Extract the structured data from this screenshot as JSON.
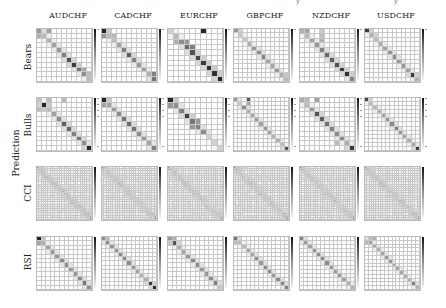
{
  "figure": {
    "top_fragments": [
      "y",
      "y"
    ],
    "group_label": "Prediction",
    "columns": [
      "AUDCHF",
      "CADCHF",
      "EURCHF",
      "GBPCHF",
      "NZDCHF",
      "USDCHF"
    ],
    "rows": [
      "Bears",
      "Bulls",
      "CCI",
      "RSI"
    ]
  },
  "chart_data": {
    "type": "heatmap",
    "title": "",
    "xlabel": "",
    "ylabel": "Prediction",
    "colormap": "greys",
    "colorbar": true,
    "grid": true,
    "layout": {
      "rows": 4,
      "cols": 6
    },
    "panels": [
      {
        "row": "Bears",
        "col": "AUDCHF",
        "size": 11,
        "diag": [
          0.45,
          0.3,
          0.35,
          0.4,
          0.45,
          0.55,
          0.75,
          0.85,
          0.6,
          0.5,
          0.3
        ],
        "extra": [
          [
            0,
            2,
            0.4
          ],
          [
            1,
            0,
            0.35
          ],
          [
            0,
            1,
            0.15
          ],
          [
            8,
            9,
            0.4
          ],
          [
            9,
            10,
            0.3
          ]
        ]
      },
      {
        "row": "Bears",
        "col": "CADCHF",
        "size": 11,
        "diag": [
          0.95,
          0.3,
          0.3,
          0.4,
          0.55,
          0.7,
          0.55,
          0.45,
          0.4,
          0.35,
          0.6
        ],
        "extra": [
          [
            1,
            0,
            0.45
          ],
          [
            1,
            2,
            0.3
          ],
          [
            9,
            10,
            0.55
          ]
        ]
      },
      {
        "row": "Bears",
        "col": "EURCHF",
        "size": 10,
        "diag": [
          0.2,
          0.3,
          0.5,
          0.65,
          0.75,
          0.8,
          0.85,
          0.9,
          0.9,
          0.95
        ],
        "extra": [
          [
            0,
            6,
            0.95
          ],
          [
            2,
            1,
            0.35
          ],
          [
            2,
            3,
            0.45
          ],
          [
            3,
            4,
            0.55
          ]
        ]
      },
      {
        "row": "Bears",
        "col": "GBPCHF",
        "size": 12,
        "diag": [
          0.45,
          0.25,
          0.25,
          0.35,
          0.45,
          0.5,
          0.55,
          0.4,
          0.4,
          0.45,
          0.35,
          0.3
        ],
        "extra": [
          [
            0,
            1,
            0.2
          ],
          [
            10,
            11,
            0.25
          ]
        ]
      },
      {
        "row": "Bears",
        "col": "NZDCHF",
        "size": 11,
        "diag": [
          0.35,
          0.3,
          0.4,
          0.45,
          0.55,
          0.65,
          0.7,
          0.75,
          0.85,
          0.9,
          0.55
        ],
        "extra": [
          [
            0,
            1,
            0.4
          ],
          [
            0,
            4,
            0.25
          ],
          [
            1,
            4,
            0.3
          ],
          [
            2,
            4,
            0.35
          ]
        ]
      },
      {
        "row": "Bears",
        "col": "USDCHF",
        "size": 12,
        "diag": [
          0.85,
          0.35,
          0.3,
          0.35,
          0.4,
          0.45,
          0.5,
          0.45,
          0.45,
          0.4,
          0.85,
          0.35
        ],
        "extra": [
          [
            0,
            1,
            0.2
          ],
          [
            1,
            2,
            0.2
          ]
        ]
      },
      {
        "row": "Bulls",
        "col": "AUDCHF",
        "size": 11,
        "diag": [
          0.25,
          0.95,
          0.3,
          0.4,
          0.5,
          0.7,
          0.65,
          0.55,
          0.6,
          0.5,
          0.95
        ],
        "extra": [
          [
            0,
            2,
            0.3
          ],
          [
            0,
            5,
            0.3
          ],
          [
            2,
            0,
            0.3
          ],
          [
            2,
            1,
            0.25
          ]
        ]
      },
      {
        "row": "Bulls",
        "col": "CADCHF",
        "size": 11,
        "diag": [
          0.95,
          0.4,
          0.45,
          0.5,
          0.6,
          0.65,
          0.6,
          0.5,
          0.45,
          0.4,
          0.55
        ],
        "extra": [
          [
            1,
            0,
            0.4
          ]
        ]
      },
      {
        "row": "Bulls",
        "col": "EURCHF",
        "size": 10,
        "diag": [
          0.95,
          0.5,
          0.55,
          0.85,
          0.6,
          0.55,
          0.5,
          0.2,
          0.2,
          0.2
        ],
        "extra": [
          [
            0,
            0,
            0.95
          ],
          [
            1,
            0,
            0.45
          ],
          [
            4,
            5,
            0.45
          ],
          [
            5,
            4,
            0.45
          ]
        ]
      },
      {
        "row": "Bulls",
        "col": "GBPCHF",
        "size": 13,
        "diag": [
          0.45,
          0.25,
          0.5,
          0.35,
          0.4,
          0.45,
          0.4,
          0.45,
          0.4,
          0.35,
          0.35,
          0.3,
          0.75
        ],
        "extra": [
          [
            0,
            3,
            0.75
          ],
          [
            1,
            3,
            0.4
          ]
        ]
      },
      {
        "row": "Bulls",
        "col": "NZDCHF",
        "size": 11,
        "diag": [
          0.35,
          0.3,
          0.45,
          0.75,
          0.7,
          0.6,
          0.55,
          0.5,
          0.5,
          0.35,
          0.85
        ],
        "extra": [
          [
            0,
            1,
            0.3
          ],
          [
            0,
            3,
            0.4
          ],
          [
            9,
            7,
            0.3
          ]
        ]
      },
      {
        "row": "Bulls",
        "col": "USDCHF",
        "size": 13,
        "diag": [
          0.8,
          0.3,
          0.3,
          0.35,
          0.4,
          0.45,
          0.5,
          0.55,
          0.45,
          0.4,
          0.35,
          0.4,
          0.85
        ],
        "extra": [
          [
            0,
            1,
            0.2
          ]
        ]
      },
      {
        "row": "CCI",
        "col": "AUDCHF",
        "size": 24,
        "diag": "noisy",
        "level": 0.25
      },
      {
        "row": "CCI",
        "col": "CADCHF",
        "size": 24,
        "diag": "noisy",
        "level": 0.22
      },
      {
        "row": "CCI",
        "col": "EURCHF",
        "size": 24,
        "diag": "noisy",
        "level": 0.22
      },
      {
        "row": "CCI",
        "col": "GBPCHF",
        "size": 24,
        "diag": "noisy",
        "level": 0.22
      },
      {
        "row": "CCI",
        "col": "NZDCHF",
        "size": 24,
        "diag": "noisy",
        "level": 0.22
      },
      {
        "row": "CCI",
        "col": "USDCHF",
        "size": 24,
        "diag": "noisy",
        "level": 0.22
      },
      {
        "row": "RSI",
        "col": "AUDCHF",
        "size": 12,
        "diag": [
          0.95,
          0.35,
          0.4,
          0.45,
          0.45,
          0.5,
          0.5,
          0.45,
          0.45,
          0.5,
          0.6,
          0.5
        ],
        "extra": [
          [
            1,
            0,
            0.4
          ]
        ]
      },
      {
        "row": "RSI",
        "col": "CADCHF",
        "size": 13,
        "diag": [
          0.5,
          0.5,
          0.45,
          0.45,
          0.5,
          0.5,
          0.5,
          0.45,
          0.4,
          0.35,
          0.35,
          0.85,
          0.9
        ],
        "extra": [
          [
            0,
            1,
            0.3
          ]
        ]
      },
      {
        "row": "RSI",
        "col": "EURCHF",
        "size": 12,
        "diag": [
          0.45,
          0.75,
          0.35,
          0.4,
          0.45,
          0.5,
          0.5,
          0.45,
          0.45,
          0.5,
          0.55,
          0.25
        ],
        "extra": [
          [
            0,
            1,
            0.35
          ],
          [
            1,
            0,
            0.25
          ]
        ]
      },
      {
        "row": "RSI",
        "col": "GBPCHF",
        "size": 13,
        "diag": [
          0.6,
          0.3,
          0.3,
          0.4,
          0.4,
          0.5,
          0.45,
          0.5,
          0.5,
          0.45,
          0.5,
          0.55,
          0.55
        ],
        "extra": [
          [
            1,
            0,
            0.3
          ]
        ]
      },
      {
        "row": "RSI",
        "col": "NZDCHF",
        "size": 13,
        "diag": [
          0.55,
          0.45,
          0.4,
          0.45,
          0.5,
          0.5,
          0.5,
          0.45,
          0.45,
          0.45,
          0.4,
          0.35,
          0.35
        ],
        "extra": []
      },
      {
        "row": "RSI",
        "col": "USDCHF",
        "size": 14,
        "diag": [
          0.15,
          0.4,
          0.4,
          0.35,
          0.4,
          0.45,
          0.45,
          0.4,
          0.4,
          0.4,
          0.35,
          0.35,
          0.55,
          0.35
        ],
        "extra": [
          [
            0,
            1,
            0.3
          ],
          [
            0,
            2,
            0.35
          ],
          [
            1,
            0,
            0.3
          ]
        ]
      }
    ]
  }
}
